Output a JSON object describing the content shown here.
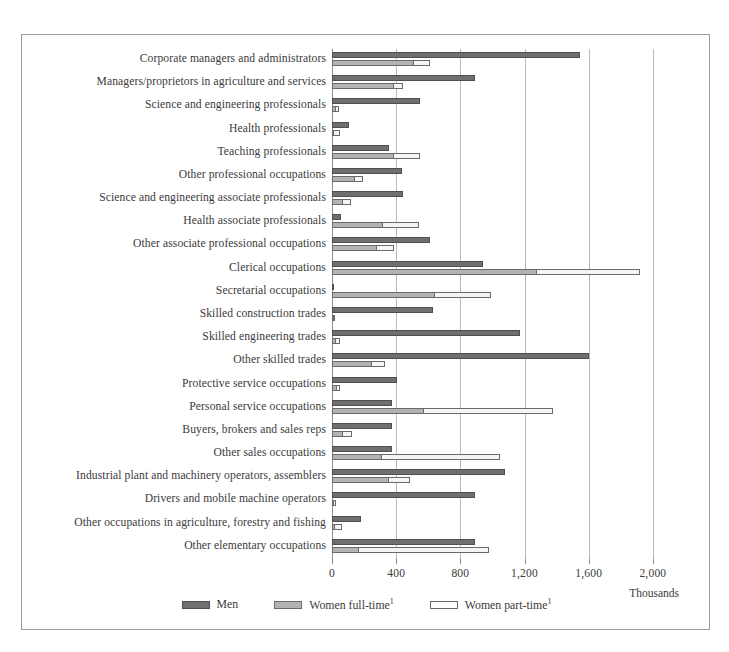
{
  "chart_data": {
    "type": "bar",
    "orientation": "horizontal",
    "title": "",
    "subtitle": "",
    "xlabel": "Thousands",
    "ylabel": "",
    "xlim": [
      0,
      2350
    ],
    "xticks": [
      0,
      400,
      800,
      1200,
      1600,
      2000
    ],
    "xticklabels": [
      "0",
      "400",
      "800",
      "1,200",
      "1,600",
      "2,000"
    ],
    "grid": "vertical",
    "legend_position": "bottom-center",
    "legend": [
      "Men",
      "Women full-time¹",
      "Women part-time¹"
    ],
    "categories": [
      "Corporate managers and administrators",
      "Managers/proprietors in agriculture and services",
      "Science and engineering professionals",
      "Health professionals",
      "Teaching professionals",
      "Other professional occupations",
      "Science and engineering associate professionals",
      "Health associate professionals",
      "Other associate professional occupations",
      "Clerical occupations",
      "Secretarial occupations",
      "Skilled construction trades",
      "Skilled engineering trades",
      "Other skilled trades",
      "Protective service occupations",
      "Personal service occupations",
      "Buyers, brokers and sales reps",
      "Other sales occupations",
      "Industrial plant and machinery operators, assemblers",
      "Drivers and mobile machine operators",
      "Other occupations in agriculture, forestry and fishing",
      "Other elementary occupations"
    ],
    "series": [
      {
        "name": "Men",
        "color": "#6f6f6f",
        "values": [
          1546,
          894,
          546,
          105,
          358,
          437,
          441,
          58,
          609,
          939,
          12,
          628,
          1169,
          1604,
          407,
          371,
          375,
          375,
          1076,
          889,
          178,
          893
        ]
      },
      {
        "name": "Women full-time¹",
        "color": "#b3b3b3",
        "values": [
          514,
          385,
          27,
          14,
          385,
          143,
          68,
          317,
          282,
          1280,
          645,
          4,
          22,
          251,
          33,
          572,
          70,
          313,
          358,
          8,
          18,
          168
        ]
      },
      {
        "name": "Women part-time¹",
        "color": "#ffffff",
        "values": [
          610,
          445,
          43,
          52,
          551,
          193,
          116,
          541,
          385,
          1919,
          991,
          16,
          47,
          329,
          50,
          1380,
          122,
          1048,
          485,
          22,
          60,
          976
        ]
      }
    ]
  },
  "axis": {
    "thousands_label": "Thousands"
  }
}
